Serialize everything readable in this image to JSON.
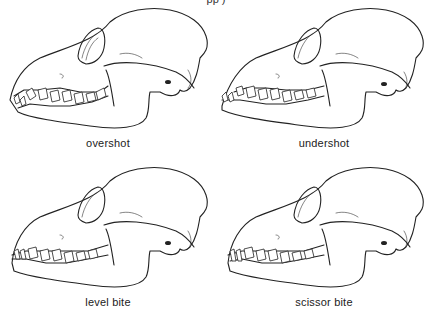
{
  "caption_top_fragment": "pp          )",
  "figures": [
    {
      "label": "overshot"
    },
    {
      "label": "undershot"
    },
    {
      "label": "level bite"
    },
    {
      "label": "scissor bite"
    }
  ]
}
